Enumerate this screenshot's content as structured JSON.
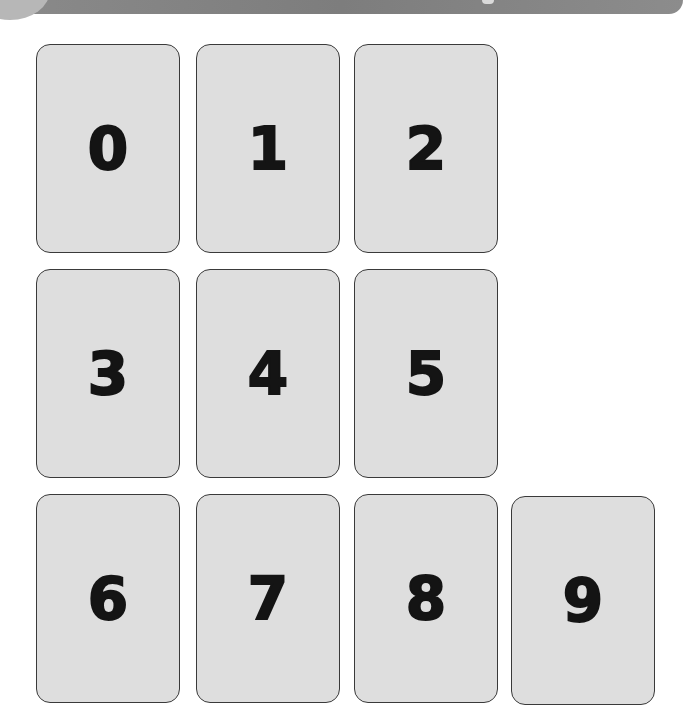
{
  "cards": [
    {
      "label": "0"
    },
    {
      "label": "1"
    },
    {
      "label": "2"
    },
    {
      "label": "3"
    },
    {
      "label": "4"
    },
    {
      "label": "5"
    },
    {
      "label": "6"
    },
    {
      "label": "7"
    },
    {
      "label": "8"
    },
    {
      "label": "9"
    }
  ],
  "colors": {
    "card_fill": "#dedede",
    "card_border": "#3a3a3a",
    "digit": "#141414",
    "banner": "#858585",
    "background": "#ffffff"
  }
}
